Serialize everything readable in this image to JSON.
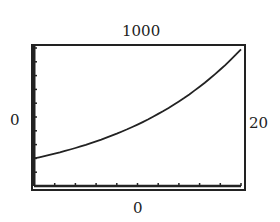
{
  "chart_data": {
    "type": "line",
    "title": "",
    "xlabel": "",
    "ylabel": "",
    "xlim": [
      0,
      20
    ],
    "ylim": [
      0,
      1000
    ],
    "window_labels": {
      "ymax": "1000",
      "ymin": "0",
      "xmin": "0",
      "xmax": "20"
    },
    "x_ticks_count": 10,
    "y_ticks_count": 10,
    "grid": false,
    "series": [
      {
        "name": "y = 200e^(0.08x)",
        "x": [
          0,
          2,
          4,
          6,
          8,
          10,
          12,
          14,
          16,
          18,
          20
        ],
        "y": [
          200,
          235,
          275,
          323,
          379,
          445,
          522,
          612,
          719,
          843,
          990
        ]
      }
    ]
  },
  "labels": {
    "ymax": "1000",
    "ymin": "0",
    "xmin": "0",
    "xmax": "20"
  }
}
